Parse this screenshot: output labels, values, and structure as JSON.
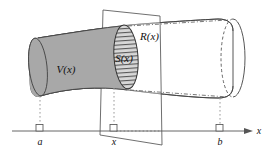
{
  "figure": {
    "type": "calculus-solid-of-revolution-diagram",
    "background_color": "#ffffff",
    "stroke_color": "#444444",
    "solid_fill_color": "#a8a8a8",
    "plane_fill_color": "#ffffff",
    "hatch_color": "#3a3a3a",
    "dotted_color": "#999999"
  },
  "labels": {
    "volume": "V(x)",
    "cross_section": "S(x)",
    "radius": "R(x)",
    "axis": "x"
  },
  "axis": {
    "name": "x-axis",
    "label": "x",
    "ticks": [
      {
        "label": "a",
        "x": 40
      },
      {
        "label": "x",
        "x": 112
      },
      {
        "label": "b",
        "x": 218
      }
    ]
  },
  "elements": {
    "solid": "shaded-solid-left-portion",
    "solid_right": "unshaded-solid-right-portion",
    "plane": "cutting-plane-at-x",
    "left_cap": "left-end-ellipse",
    "right_cap": "right-end-ellipse",
    "right_hidden_ellipse": "right-hidden-back-ellipse",
    "cross_section": "hatched-cross-section-ellipse"
  }
}
